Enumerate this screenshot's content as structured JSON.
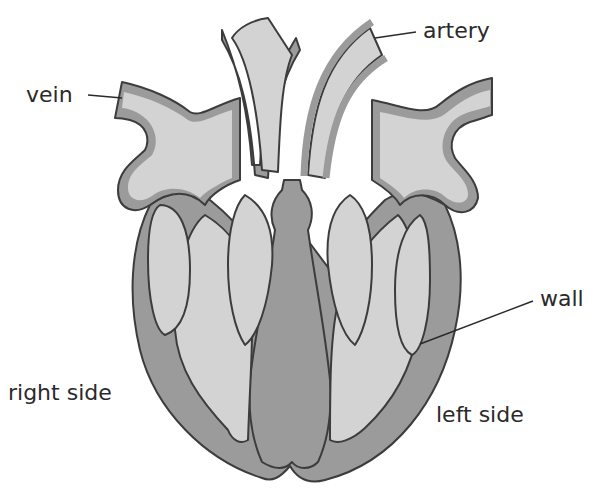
{
  "diagram": {
    "colors": {
      "chamber_fill": "#d3d3d3",
      "wall_fill": "#9b9b9b",
      "outline": "#3c3c3c",
      "label_text": "#2a2a2a",
      "background": "#ffffff"
    },
    "labels": {
      "vein": "vein",
      "artery": "artery",
      "wall": "wall",
      "right_side": "right side",
      "left_side": "left side"
    }
  }
}
